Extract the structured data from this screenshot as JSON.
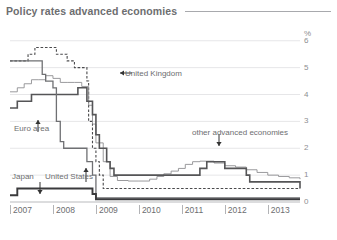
{
  "header": {
    "title": "Policy rates advanced economies"
  },
  "chart_data": {
    "type": "line",
    "title": "Policy rates advanced economies",
    "xlabel": "",
    "ylabel": "%",
    "yunit": "%",
    "grid": true,
    "legend_position": "inline-annotations",
    "xlim": [
      2007.0,
      2013.75
    ],
    "ylim": [
      0,
      6.4
    ],
    "yticks": [
      0,
      1,
      2,
      3,
      4,
      5,
      6
    ],
    "ytick_labels": [
      "0",
      "1",
      "2",
      "3",
      "4",
      "5",
      "6"
    ],
    "xticks": [
      2007,
      2008,
      2009,
      2010,
      2011,
      2012,
      2013
    ],
    "xtick_labels": [
      "2007",
      "2008",
      "2009",
      "2010",
      "2011",
      "2012",
      "2013"
    ],
    "interpolation": "step",
    "series": [
      {
        "name": "United Kingdom",
        "style": "dashed",
        "color": "#4a4a4c",
        "width": 1.1,
        "x": [
          2007.0,
          2007.25,
          2007.42,
          2007.58,
          2007.75,
          2007.92,
          2008.08,
          2008.17,
          2008.33,
          2008.5,
          2008.67,
          2008.79,
          2008.83,
          2008.92,
          2009.0,
          2009.08,
          2009.17,
          2009.25,
          2009.33,
          2013.75
        ],
        "y": [
          5.25,
          5.25,
          5.5,
          5.75,
          5.75,
          5.75,
          5.5,
          5.5,
          5.25,
          5.0,
          5.0,
          4.5,
          3.0,
          2.0,
          1.5,
          1.0,
          0.5,
          0.5,
          0.5,
          0.5
        ]
      },
      {
        "name": "other advanced economies",
        "style": "solid",
        "color": "#8e8f92",
        "width": 0.9,
        "x": [
          2007.0,
          2007.17,
          2007.33,
          2007.5,
          2007.67,
          2007.83,
          2008.0,
          2008.17,
          2008.33,
          2008.5,
          2008.67,
          2008.83,
          2008.92,
          2009.0,
          2009.17,
          2009.33,
          2009.5,
          2009.75,
          2010.0,
          2010.25,
          2010.42,
          2010.58,
          2010.75,
          2010.92,
          2011.08,
          2011.25,
          2011.42,
          2011.58,
          2011.75,
          2012.0,
          2012.25,
          2012.5,
          2012.75,
          2013.0,
          2013.25,
          2013.5,
          2013.75
        ],
        "y": [
          4.1,
          4.25,
          4.4,
          4.55,
          4.55,
          4.7,
          4.6,
          4.45,
          4.45,
          4.45,
          4.3,
          3.6,
          2.9,
          2.2,
          1.5,
          0.95,
          0.8,
          0.78,
          0.78,
          0.85,
          0.95,
          1.05,
          1.15,
          1.25,
          1.4,
          1.5,
          1.52,
          1.52,
          1.45,
          1.35,
          1.3,
          1.2,
          1.1,
          1.0,
          0.95,
          0.9,
          0.85
        ]
      },
      {
        "name": "Euro area",
        "style": "solid",
        "color": "#555557",
        "width": 1.6,
        "x": [
          2007.0,
          2007.17,
          2007.42,
          2007.5,
          2008.5,
          2008.58,
          2008.79,
          2008.92,
          2009.0,
          2009.08,
          2009.25,
          2009.33,
          2009.42,
          2011.25,
          2011.42,
          2011.58,
          2011.83,
          2012.0,
          2012.5,
          2012.58,
          2013.33,
          2013.75
        ],
        "y": [
          3.5,
          3.75,
          3.75,
          4.0,
          4.0,
          4.25,
          3.75,
          3.25,
          2.5,
          2.0,
          1.5,
          1.25,
          1.0,
          1.0,
          1.25,
          1.5,
          1.5,
          1.25,
          1.0,
          0.75,
          0.75,
          0.5
        ]
      },
      {
        "name": "United States",
        "style": "solid",
        "color": "#6f7073",
        "width": 1.3,
        "x": [
          2007.0,
          2007.67,
          2007.75,
          2007.83,
          2008.0,
          2008.08,
          2008.17,
          2008.25,
          2008.33,
          2008.58,
          2008.79,
          2008.92,
          2009.0,
          2013.75
        ],
        "y": [
          5.25,
          5.25,
          4.75,
          4.5,
          4.25,
          3.0,
          2.25,
          2.0,
          2.0,
          2.0,
          1.5,
          1.0,
          0.15,
          0.15
        ]
      },
      {
        "name": "Japan",
        "style": "solid",
        "color": "#3a3a3c",
        "width": 1.9,
        "x": [
          2007.0,
          2007.17,
          2008.83,
          2008.92,
          2009.0,
          2013.75
        ],
        "y": [
          0.25,
          0.5,
          0.5,
          0.3,
          0.1,
          0.1
        ]
      }
    ],
    "annotations": [
      {
        "label": "United Kingdom",
        "arrow": "left"
      },
      {
        "label": "other advanced economies",
        "arrow": "down"
      },
      {
        "label": "Euro area",
        "arrow": "up"
      },
      {
        "label": "United States",
        "arrow": "up"
      },
      {
        "label": "Japan",
        "arrow": "down"
      }
    ]
  }
}
